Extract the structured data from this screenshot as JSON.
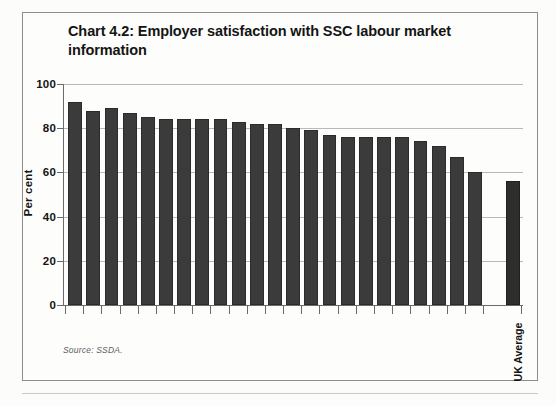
{
  "figure": {
    "title": "Chart 4.2: Employer satisfaction with SSC labour market information",
    "source_note": "Source: SSDA.",
    "avg_label": "UK Average",
    "colors": {
      "bar": "#3b3b3b",
      "average_bar": "#2e2e2e",
      "axis": "#6b6b6b",
      "grid": "#b9b9b9",
      "frame": "#8e8e8e",
      "text": "#141414"
    }
  },
  "chart_data": {
    "type": "bar",
    "title": "Chart 4.2: Employer satisfaction with SSC labour market information",
    "xlabel": "",
    "ylabel": "Per cent",
    "ylim": [
      0,
      100
    ],
    "yticks": [
      0,
      20,
      40,
      60,
      80,
      100
    ],
    "ytick_labels": [
      "0",
      "20",
      "40",
      "60",
      "80",
      "100"
    ],
    "grid": true,
    "legend": "none",
    "annotations": [
      "Source: SSDA."
    ],
    "categories": [
      "SSC 1",
      "SSC 2",
      "SSC 3",
      "SSC 4",
      "SSC 5",
      "SSC 6",
      "SSC 7",
      "SSC 8",
      "SSC 9",
      "SSC 10",
      "SSC 11",
      "SSC 12",
      "SSC 13",
      "SSC 14",
      "SSC 15",
      "SSC 16",
      "SSC 17",
      "SSC 18",
      "SSC 19",
      "SSC 20",
      "SSC 21",
      "SSC 22",
      "SSC 23",
      "UK Average"
    ],
    "category_labels_visible": [
      "UK Average"
    ],
    "values": [
      92,
      88,
      89,
      87,
      85,
      84,
      84,
      84,
      84,
      83,
      82,
      82,
      80,
      79,
      77,
      76,
      76,
      76,
      76,
      74,
      72,
      67,
      60,
      56
    ],
    "average_value": 80,
    "series": [
      {
        "name": "Employer satisfaction",
        "values": [
          92,
          88,
          89,
          87,
          85,
          84,
          84,
          84,
          84,
          83,
          82,
          82,
          80,
          79,
          77,
          76,
          76,
          76,
          76,
          74,
          72,
          67,
          60,
          56
        ]
      }
    ]
  }
}
